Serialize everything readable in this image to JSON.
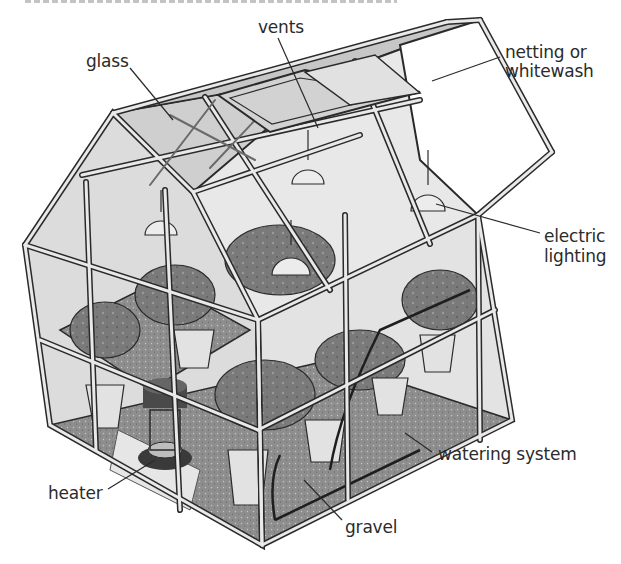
{
  "diagram": {
    "labels": {
      "vents": "vents",
      "glass": "glass",
      "netting_line1": "netting or",
      "netting_line2": "whitewash",
      "lighting_line1": "electric",
      "lighting_line2": "lighting",
      "watering": "watering system",
      "heater": "heater",
      "gravel": "gravel"
    },
    "colors": {
      "frame_stroke": "#2a2a2a",
      "frame_fill": "#e6e6e6",
      "glass_fill": "#d9d9d9",
      "roof_glass_fill": "#cfcfcf",
      "white_roof_fill": "#ffffff",
      "gravel_fill": "#8e8e8e",
      "foliage_fill": "#7a7a7a",
      "pot_fill": "#e2e2e2",
      "lamp_fill": "#ececec",
      "label_text": "#2b2b2b"
    }
  }
}
